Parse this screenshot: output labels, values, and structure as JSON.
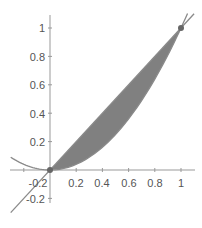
{
  "chart_data": {
    "type": "area",
    "title": "",
    "xlabel": "",
    "ylabel": "",
    "xlim": [
      -0.3,
      1.1
    ],
    "ylim": [
      -0.25,
      1.08
    ],
    "grid": false,
    "legend": null,
    "x_ticks": [
      "-0.2",
      "0.2",
      "0.4",
      "0.6",
      "0.8",
      "1"
    ],
    "y_ticks": [
      "1",
      "0.8",
      "0.6",
      "0.4",
      "0.2",
      "-0.2"
    ],
    "series": [
      {
        "name": "y = x",
        "kind": "line",
        "color": "#888888",
        "x": [
          -0.3,
          1.1
        ],
        "y": [
          -0.3,
          1.1
        ]
      },
      {
        "name": "y = x^2",
        "kind": "curve",
        "color": "#888888",
        "x": [
          -0.3,
          -0.2,
          -0.1,
          0,
          0.2,
          0.4,
          0.6,
          0.8,
          1.0
        ],
        "y": [
          0.09,
          0.04,
          0.01,
          0,
          0.04,
          0.16,
          0.36,
          0.64,
          1.0
        ]
      }
    ],
    "shaded_region": {
      "between": [
        "y = x",
        "y = x^2"
      ],
      "x_from": 0,
      "x_to": 1,
      "color": "#808080"
    },
    "points": [
      {
        "x": 0,
        "y": 0
      },
      {
        "x": 1,
        "y": 1
      }
    ]
  },
  "axes": {
    "x_tick_labels": [
      {
        "label": "-0.2",
        "value": -0.2
      },
      {
        "label": "0.2",
        "value": 0.2
      },
      {
        "label": "0.4",
        "value": 0.4
      },
      {
        "label": "0.6",
        "value": 0.6
      },
      {
        "label": "0.8",
        "value": 0.8
      },
      {
        "label": "1",
        "value": 1
      }
    ],
    "y_tick_labels": [
      {
        "label": "1",
        "value": 1
      },
      {
        "label": "0.8",
        "value": 0.8
      },
      {
        "label": "0.6",
        "value": 0.6
      },
      {
        "label": "0.4",
        "value": 0.4
      },
      {
        "label": "0.2",
        "value": 0.2
      },
      {
        "label": "-0.2",
        "value": -0.2
      }
    ]
  },
  "colors": {
    "axis": "#999999",
    "curve": "#8a8a8a",
    "fill": "#7f7f7f",
    "point": "#666666",
    "label": "#555555"
  }
}
